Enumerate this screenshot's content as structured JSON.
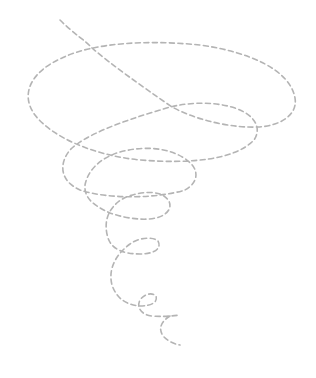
{
  "illustration": {
    "subject": "tornado spiral",
    "stroke_color": "#b4b4b4",
    "background": "#ffffff",
    "stroke_width": 1.6,
    "dash": "5 3.5",
    "path": "M 60 20 C 75 35 85 40 92 48 C 112 65 140 85 172 107 C 200 122 235 128 258 127 C 280 126 298 115 295 98 C 290 70 250 52 200 45 C 150 40 95 42 62 58 C 30 72 20 95 35 115 C 50 135 90 155 140 160 C 190 164 235 160 254 140 C 262 128 255 115 235 108 C 210 100 180 103 160 110 C 120 122 85 135 70 150 C 60 162 58 180 80 190 C 110 200 160 198 185 190 C 198 183 200 170 188 161 C 175 150 150 144 120 152 C 100 158 88 170 85 185 C 84 197 92 205 110 213 C 130 220 155 222 165 214 C 174 207 170 198 160 194 C 148 190 128 194 118 202 C 106 212 104 225 108 238 C 112 250 125 254 140 254 C 155 254 162 248 158 241 C 152 236 138 238 130 244 C 115 255 108 270 112 285 C 117 300 128 305 140 306 C 152 306 158 302 156 296 C 152 292 144 294 140 300 C 136 308 142 315 152 316 C 163 317 172 316 180 315 M 170 316 C 160 322 158 330 164 337 C 168 341 174 344 180 345"
  }
}
